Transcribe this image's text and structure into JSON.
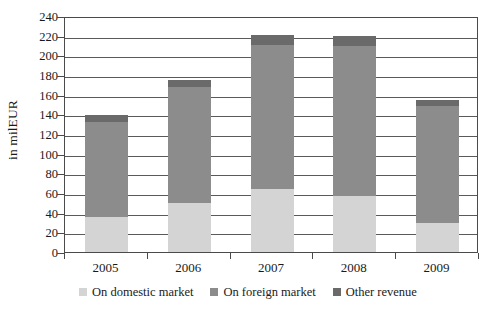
{
  "chart_data": {
    "type": "bar",
    "subtype": "stacked-bar",
    "title": "",
    "xlabel": "",
    "ylabel": "in milEUR",
    "categories": [
      "2005",
      "2006",
      "2007",
      "2008",
      "2009"
    ],
    "ylim": [
      0,
      240
    ],
    "ytick_step": 20,
    "yticks": [
      0,
      20,
      40,
      60,
      80,
      100,
      120,
      140,
      160,
      180,
      200,
      220,
      240
    ],
    "grid": true,
    "grid_axis": "y",
    "legend_position": "bottom",
    "series": [
      {
        "name": "On domestic market",
        "color": "#d4d4d4",
        "values": [
          36,
          50,
          64,
          57,
          30
        ]
      },
      {
        "name": "On foreign market",
        "color": "#8c8c8c",
        "values": [
          96,
          118,
          147,
          153,
          118
        ]
      },
      {
        "name": "Other revenue",
        "color": "#6a6a6a",
        "values": [
          7,
          7,
          10,
          10,
          7
        ]
      }
    ],
    "stack_totals": [
      139,
      175,
      221,
      220,
      155
    ]
  },
  "axis": {
    "y_title": "in milEUR"
  },
  "legend": {
    "items": [
      {
        "label": "On domestic market",
        "color": "#d4d4d4"
      },
      {
        "label": "On foreign market",
        "color": "#8c8c8c"
      },
      {
        "label": "Other revenue",
        "color": "#6a6a6a"
      }
    ]
  },
  "colors": {
    "domestic": "#d4d4d4",
    "foreign": "#8c8c8c",
    "other": "#6a6a6a",
    "axis": "#4a4a4a",
    "grid": "#5a5a5a",
    "text": "#1a1a1a",
    "background": "#ffffff"
  }
}
